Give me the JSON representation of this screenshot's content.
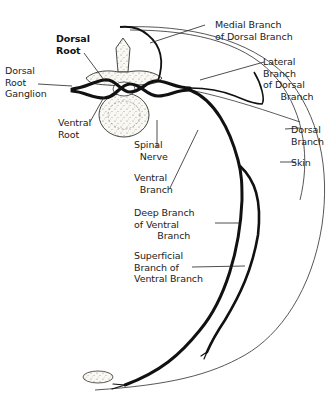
{
  "diagram": {
    "type": "anatomical-illustration",
    "labels": {
      "dorsal_root": "Dorsal\nRoot",
      "dorsal_root_ganglion": "Dorsal\nRoot\nGanglion",
      "ventral_root": "Ventral\nRoot",
      "medial_branch": "Medial Branch\nof Dorsal Branch",
      "lateral_branch": "Lateral\nBranch\nof Dorsal\n      Branch",
      "dorsal_branch": "Dorsal\nBranch",
      "skin": "Skin",
      "spinal_nerve": "Spinal\n  Nerve",
      "ventral_branch": "Ventral\n  Branch",
      "deep_branch": "Deep Branch\nof Ventral\n        Branch",
      "superficial_branch": "Superficial\nBranch of\nVentral Branch"
    },
    "colors": {
      "nerve": "#111111",
      "outline": "#333333",
      "skin": "#555555",
      "bone_fill": "#f4f1ea"
    }
  }
}
